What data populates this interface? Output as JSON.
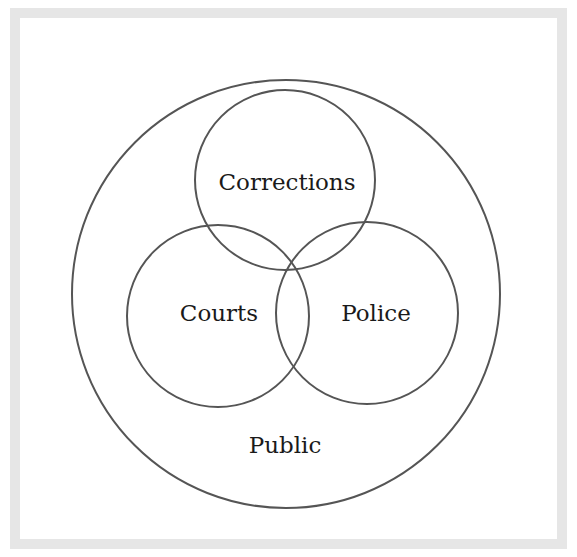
{
  "diagram": {
    "type": "venn",
    "colors": {
      "frame": "#e6e6e6",
      "background": "#ffffff",
      "stroke": "#555555",
      "text": "#1a1a1a"
    },
    "outer": {
      "label": "Public",
      "cx": 286,
      "cy": 294,
      "r": 214,
      "label_x": 285,
      "label_y": 453
    },
    "circles": [
      {
        "label": "Corrections",
        "cx": 285,
        "cy": 180,
        "r": 90,
        "label_x": 287,
        "label_y": 190
      },
      {
        "label": "Courts",
        "cx": 218,
        "cy": 316,
        "r": 91,
        "label_x": 219,
        "label_y": 321
      },
      {
        "label": "Police",
        "cx": 367,
        "cy": 313,
        "r": 91,
        "label_x": 376,
        "label_y": 321
      }
    ]
  }
}
